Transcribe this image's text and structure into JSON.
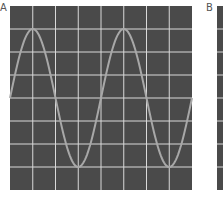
{
  "panels": [
    {
      "label": "A"
    },
    {
      "label": "B"
    }
  ],
  "colors": {
    "screen": "#4a4a4a",
    "grid": "#d9d9d9",
    "trace": "#a8a8a8"
  },
  "chart_data": {
    "type": "line",
    "title": "",
    "panel": "A",
    "grid": {
      "columns": 8,
      "rows": 8
    },
    "xlabel": "",
    "ylabel": "",
    "xlim": [
      0,
      8
    ],
    "ylim": [
      -4,
      4
    ],
    "series": [
      {
        "name": "sine",
        "amplitude_divisions": 3,
        "period_divisions": 4,
        "phase": "starts at zero crossing rising at left edge",
        "x": [
          0,
          1,
          2,
          3,
          4,
          5,
          6,
          7,
          8
        ],
        "values": [
          0,
          3,
          0,
          -3,
          0,
          3,
          0,
          -3,
          0
        ]
      }
    ]
  }
}
